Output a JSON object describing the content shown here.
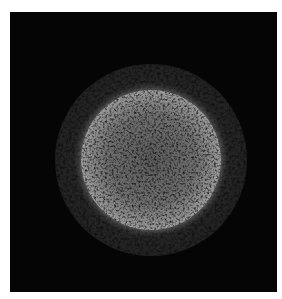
{
  "image": {
    "subject": "circular speckled disc on black background",
    "colors": {
      "page_background": "#ffffff",
      "frame_background": "#050505",
      "disc_rim": "#f4f4f4",
      "disc_center": "#5a5a5a",
      "halo": "#5a5a5a"
    },
    "frame": {
      "x": 10,
      "y": 12,
      "width": 267,
      "height": 280
    },
    "disc": {
      "cx": 141,
      "cy": 148,
      "radius": 70
    },
    "halo": {
      "cx": 141,
      "cy": 148,
      "radius": 96
    }
  }
}
